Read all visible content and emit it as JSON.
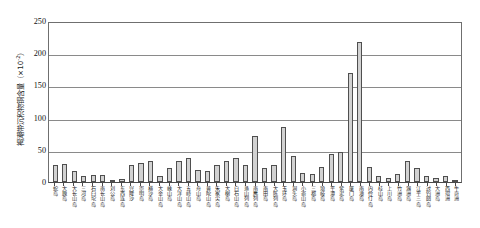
{
  "chart_data": {
    "type": "bar",
    "title": "",
    "xlabel": "",
    "ylabel": "褐潮带沉积物铜含量（×10⁻²）",
    "ylabel_main": "褐潮带沉积物铜含量（×10",
    "ylabel_sup": "-2",
    "ylabel_tail": "）",
    "ylim": [
      0,
      250
    ],
    "ytick_labels": [
      "250",
      "200",
      "150",
      "100",
      "50",
      "0"
    ],
    "ytick_values": [
      250,
      200,
      150,
      100,
      50,
      0
    ],
    "grid": "horizontal",
    "legend": "none",
    "bar_fill": "#d2d2d2",
    "bar_edge": "#4f4f4f",
    "categories": [
      "蛇岛",
      "大鹿岛",
      "大长山岛",
      "三河岛",
      "石臼坨岛",
      "南长山岛",
      "刘公岛",
      "东西连岛",
      "兴隆沙",
      "崇明岛",
      "横沙岛",
      "大金山岛",
      "嵊山岛",
      "大洋山岛",
      "五峙山岛",
      "舟山岛",
      "普陀山岛",
      "朱家尖岛",
      "大榭岛",
      "白石山岛",
      "渔山列岛",
      "南麂列岛",
      "南田岛",
      "大陈列岛",
      "玉环岛",
      "洞头岛",
      "小嵛山岛",
      "三都岛",
      "琅岐岛",
      "平潭岛",
      "紫泥岛",
      "厦门岛",
      "南澳岛",
      "内伶仃岛",
      "桂山岛",
      "上川岛",
      "竹洲岛",
      "涠洲岛",
      "江平三岛",
      "过钓圆岛",
      "大洲岛",
      "西瑁洲",
      "牛奇洲"
    ],
    "values": [
      27,
      28,
      17,
      9,
      11,
      11,
      2,
      4,
      27,
      29,
      32,
      9,
      22,
      33,
      38,
      18,
      17,
      26,
      32,
      37,
      26,
      71,
      21,
      26,
      86,
      40,
      14,
      12,
      24,
      44,
      47,
      170,
      218,
      23,
      10,
      6,
      12,
      32,
      22,
      10,
      6,
      9,
      3
    ]
  },
  "axes": {
    "y_axis_name": "y-axis",
    "x_axis_name": "x-axis"
  }
}
